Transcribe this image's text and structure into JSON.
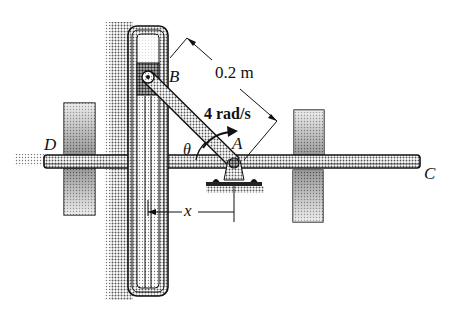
{
  "diagram": {
    "type": "slotted-link mechanism",
    "points": {
      "A": "A",
      "B": "B",
      "C": "C",
      "D": "D"
    },
    "dimensions": {
      "length_AB": "0.2 m",
      "angular_velocity": "4 rad/s",
      "angle": "θ",
      "distance": "x"
    },
    "colors": {
      "ink": "#111111",
      "background": "#ffffff",
      "halftone": "#8a8a8a"
    }
  }
}
